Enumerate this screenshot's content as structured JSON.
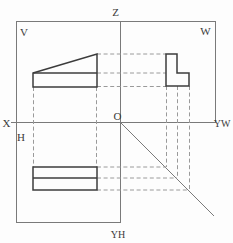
{
  "figure": {
    "type": "descriptive-geometry-projection-drawing",
    "labels": {
      "z_axis": "Z",
      "x_axis": "X",
      "yw_axis": "YW",
      "yh_axis": "YH",
      "origin": "O",
      "front_plane": "V",
      "profile_plane": "W",
      "horizontal_plane": "H"
    },
    "colors": {
      "background": "#fdfdfd",
      "frame_line": "#7a7a7a",
      "object_line": "#3c3c3c",
      "projection_line": "#9a9a9a"
    }
  }
}
